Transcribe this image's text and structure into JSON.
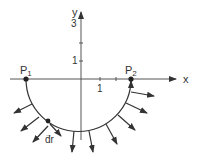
{
  "diagram": {
    "axes": {
      "x_label": "x",
      "y_label": "y",
      "x_ticks": [
        {
          "label": "1",
          "x": 100
        },
        {
          "label": "",
          "x": 116
        }
      ],
      "y_ticks": [
        {
          "label": "1",
          "y": 61
        },
        {
          "label": "",
          "y": 43
        },
        {
          "label": "3",
          "y": 24
        }
      ]
    },
    "points": [
      {
        "label": "P",
        "sub": "1",
        "x": 26,
        "y": 79
      },
      {
        "label": "P",
        "sub": "2",
        "x": 131,
        "y": 79
      }
    ],
    "path_element": {
      "label": "dr",
      "vector_arrow": "→"
    },
    "colors": {
      "ink": "#333333",
      "axis": "#555555",
      "background": "#ffffff"
    }
  }
}
